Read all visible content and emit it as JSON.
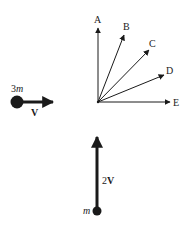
{
  "diagram": {
    "colors": {
      "ink": "#1a1a1a",
      "background": "#ffffff"
    },
    "mass_left": {
      "label_coef": "3",
      "label_var": "m",
      "velocity_label": "V"
    },
    "mass_bottom": {
      "label_var": "m",
      "velocity_coef": "2",
      "velocity_label": "V"
    },
    "direction_options": [
      {
        "label": "A"
      },
      {
        "label": "B"
      },
      {
        "label": "C"
      },
      {
        "label": "D"
      },
      {
        "label": "E"
      }
    ]
  }
}
